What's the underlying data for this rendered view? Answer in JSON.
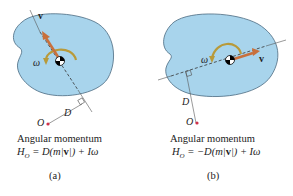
{
  "colors": {
    "body_fill": "#a8d4ec",
    "body_stroke": "#4a6a80",
    "velocity_arrow": "#c8703c",
    "omega_arc": "#b89a3a",
    "point_O": "#d0304a",
    "line": "#555555"
  },
  "panels": [
    {
      "id": "a",
      "labels": {
        "v": "v",
        "omega": "ω",
        "O": "O",
        "D": "D"
      },
      "caption_title": "Angular momentum",
      "equation": "H_O = D(m|v|) + Iω",
      "equation_parts": {
        "lhs": "H",
        "sub": "O",
        "eq": " = D(m|",
        "v": "v",
        "rest": "|) + Iω"
      },
      "panel_label": "(a)"
    },
    {
      "id": "b",
      "labels": {
        "v": "v",
        "omega": "ω",
        "O": "O",
        "D": "D"
      },
      "caption_title": "Angular momentum",
      "equation": "H_O = −D(m|v|) + Iω",
      "equation_parts": {
        "lhs": "H",
        "sub": "O",
        "eq": " = −D(m|",
        "v": "v",
        "rest": "|) + Iω"
      },
      "panel_label": "(b)"
    }
  ]
}
